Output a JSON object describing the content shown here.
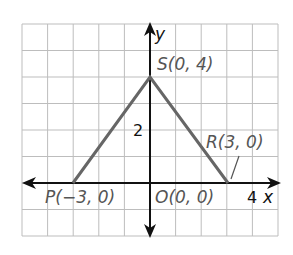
{
  "chart_data": {
    "type": "coordinate-plane-figure",
    "title": "",
    "xlabel": "x",
    "ylabel": "y",
    "xlim": [
      -5,
      5
    ],
    "ylim": [
      -2,
      6
    ],
    "grid": true,
    "grid_step": 1,
    "tick_labels": [
      {
        "axis": "x",
        "value": 4,
        "text": "4"
      },
      {
        "axis": "y",
        "value": 2,
        "text": "2"
      }
    ],
    "points": [
      {
        "name": "P",
        "x": -3,
        "y": 0,
        "label": "P(−3, 0)"
      },
      {
        "name": "O",
        "x": 0,
        "y": 0,
        "label": "O(0, 0)"
      },
      {
        "name": "R",
        "x": 3,
        "y": 0,
        "label": "R(3, 0)"
      },
      {
        "name": "S",
        "x": 0,
        "y": 4,
        "label": "S(0, 4)"
      }
    ],
    "segments": [
      {
        "from": "P",
        "to": "S"
      },
      {
        "from": "S",
        "to": "R"
      }
    ]
  },
  "labels": {
    "x_axis": "x",
    "y_axis": "y",
    "tick_x4": "4",
    "tick_y2": "2",
    "P": "P(−3, 0)",
    "O": "O(0, 0)",
    "R": "R(3, 0)",
    "S": "S(0, 4)"
  },
  "colors": {
    "grid": "#bdbdbd",
    "axis": "#111111",
    "figure": "#666666",
    "label": "#555555"
  }
}
